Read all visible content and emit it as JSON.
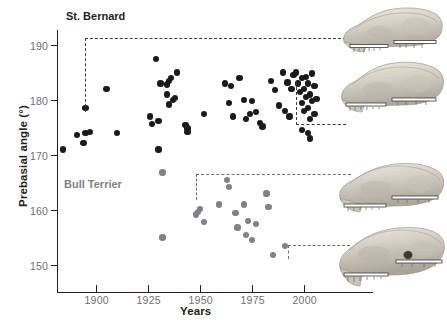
{
  "figure": {
    "xlabel": "Years",
    "ylabel": "Prebasial angle (°)",
    "series_labels": {
      "st_bernard": "St. Bernard",
      "bull_terrier": "Bull Terrier"
    },
    "colors": {
      "st_bernard": "#1a1a1a",
      "bull_terrier": "#808285",
      "axis": "#231f20",
      "tick_label": "#6d6e71",
      "callout_dash": "#6d6e71"
    },
    "skull_labels": [
      "st-bernard-historic-skull",
      "st-bernard-modern-skull",
      "bull-terrier-historic-skull",
      "bull-terrier-modern-skull"
    ]
  },
  "chart_data": {
    "type": "scatter",
    "title": "",
    "xlabel": "Years",
    "ylabel": "Prebasial angle (°)",
    "xlim": [
      1878,
      2030
    ],
    "ylim": [
      143,
      194
    ],
    "xticks": [
      1900,
      1925,
      1950,
      1975,
      2000
    ],
    "yticks": [
      150,
      160,
      170,
      180,
      190
    ],
    "grid": false,
    "legend": "inline-text-labels",
    "series": [
      {
        "name": "St. Bernard",
        "color": "#1a1a1a",
        "points": [
          [
            1884,
            171.0
          ],
          [
            1891,
            173.6
          ],
          [
            1894,
            172.2
          ],
          [
            1895,
            174.0
          ],
          [
            1897,
            174.2
          ],
          [
            1895,
            178.6
          ],
          [
            1905,
            182.0
          ],
          [
            1910,
            174.0
          ],
          [
            1926,
            177.0
          ],
          [
            1927,
            175.6
          ],
          [
            1930,
            176.2
          ],
          [
            1929,
            187.5
          ],
          [
            1931,
            183.0
          ],
          [
            1934,
            182.8
          ],
          [
            1936,
            184.0
          ],
          [
            1935,
            183.5
          ],
          [
            1939,
            185.0
          ],
          [
            1934,
            181.0
          ],
          [
            1935,
            179.2
          ],
          [
            1937,
            180.0
          ],
          [
            1938,
            180.4
          ],
          [
            1930,
            171.0
          ],
          [
            1943,
            175.5
          ],
          [
            1944,
            174.8
          ],
          [
            1944,
            174.2
          ],
          [
            1952,
            177.5
          ],
          [
            1962,
            183.0
          ],
          [
            1965,
            182.5
          ],
          [
            1964,
            179.5
          ],
          [
            1966,
            177.0
          ],
          [
            1969,
            184.0
          ],
          [
            1971,
            180.0
          ],
          [
            1972,
            176.6
          ],
          [
            1974,
            177.5
          ],
          [
            1975,
            179.8
          ],
          [
            1977,
            177.8
          ],
          [
            1979,
            175.8
          ],
          [
            1980,
            175.2
          ],
          [
            1984,
            183.5
          ],
          [
            1986,
            181.8
          ],
          [
            1988,
            179.0
          ],
          [
            1990,
            185.0
          ],
          [
            1992,
            183.2
          ],
          [
            1991,
            178.0
          ],
          [
            1993,
            177.0
          ],
          [
            1994,
            182.0
          ],
          [
            1995,
            184.5
          ],
          [
            1996,
            185.0
          ],
          [
            1997,
            183.0
          ],
          [
            1998,
            181.5
          ],
          [
            1999,
            184.0
          ],
          [
            1999,
            179.5
          ],
          [
            2000,
            182.0
          ],
          [
            2000,
            178.0
          ],
          [
            2001,
            180.5
          ],
          [
            2001,
            184.2
          ],
          [
            2002,
            183.0
          ],
          [
            2002,
            178.6
          ],
          [
            2003,
            181.0
          ],
          [
            2003,
            176.5
          ],
          [
            2004,
            184.8
          ],
          [
            2004,
            179.8
          ],
          [
            2005,
            182.5
          ],
          [
            2005,
            177.5
          ],
          [
            2006,
            180.2
          ],
          [
            1999,
            174.5
          ],
          [
            2002,
            174.0
          ],
          [
            2003,
            173.0
          ]
        ]
      },
      {
        "name": "Bull Terrier",
        "color": "#808285",
        "points": [
          [
            1932,
            166.8
          ],
          [
            1932,
            155.0
          ],
          [
            1948,
            159.2
          ],
          [
            1949,
            159.6
          ],
          [
            1950,
            160.2
          ],
          [
            1952,
            157.8
          ],
          [
            1963,
            165.5
          ],
          [
            1964,
            164.2
          ],
          [
            1959,
            161.0
          ],
          [
            1967,
            159.4
          ],
          [
            1968,
            156.8
          ],
          [
            1971,
            161.0
          ],
          [
            1973,
            158.0
          ],
          [
            1972,
            155.4
          ],
          [
            1975,
            154.6
          ],
          [
            1977,
            157.5
          ],
          [
            1982,
            163.0
          ],
          [
            1983,
            160.6
          ],
          [
            1985,
            151.8
          ],
          [
            1991,
            153.4
          ]
        ]
      }
    ],
    "callouts": [
      {
        "name": "st-bernard-historic",
        "year": 1895,
        "angle": 178.6,
        "target": "st-bernard-historic-skull"
      },
      {
        "name": "st-bernard-modern",
        "year": 2001,
        "angle": 180.5,
        "target": "st-bernard-modern-skull"
      },
      {
        "name": "bull-terrier-historic",
        "year": 1949,
        "angle": 159.6,
        "target": "bull-terrier-historic-skull"
      },
      {
        "name": "bull-terrier-modern",
        "year": 1991,
        "angle": 153.4,
        "target": "bull-terrier-modern-skull"
      }
    ]
  }
}
